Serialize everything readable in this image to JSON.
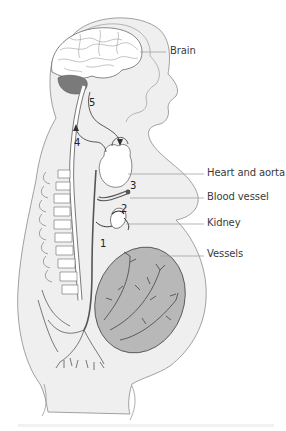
{
  "diagram": {
    "type": "anatomical",
    "labels": [
      {
        "id": "brain",
        "text": "Brain"
      },
      {
        "id": "heart",
        "text": "Heart and aorta"
      },
      {
        "id": "blood_vessel",
        "text": "Blood vessel"
      },
      {
        "id": "kidney",
        "text": "Kidney"
      },
      {
        "id": "vessels",
        "text": "Vessels"
      }
    ],
    "markers": [
      {
        "id": "m1",
        "text": "1"
      },
      {
        "id": "m2",
        "text": "2"
      },
      {
        "id": "m3",
        "text": "3"
      },
      {
        "id": "m4",
        "text": "4"
      },
      {
        "id": "m5",
        "text": "5"
      }
    ],
    "colors": {
      "body_fill": "#efefef",
      "outline": "#8a8a8a",
      "cerebellum": "#7a7a7a",
      "uterus": "#b8b8b8",
      "vessel": "#555555",
      "leader_line": "#9a9a9a"
    }
  }
}
